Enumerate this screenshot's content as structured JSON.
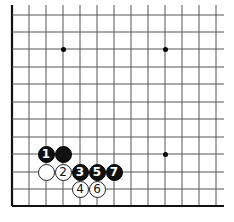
{
  "board": {
    "grid": {
      "x_lines": [
        12,
        29,
        46,
        63,
        80,
        97,
        114,
        131,
        148,
        165,
        182,
        199,
        216
      ],
      "y_lines": [
        15,
        32,
        49,
        67,
        84,
        102,
        119,
        137,
        154,
        172,
        189,
        206
      ],
      "right_extent": 224,
      "top_extent": 5,
      "left_edge_thick": true,
      "bottom_edge_thick": true,
      "line_color": "#555555",
      "edge_color": "#111111"
    },
    "star_points": [
      {
        "col": 3,
        "row": 2
      },
      {
        "col": 9,
        "row": 2
      },
      {
        "col": 9,
        "row": 8
      }
    ],
    "stones": [
      {
        "color": "black",
        "col": 2,
        "row": 8,
        "label": "1"
      },
      {
        "color": "black",
        "col": 3,
        "row": 8,
        "label": ""
      },
      {
        "color": "white",
        "col": 2,
        "row": 9,
        "label": ""
      },
      {
        "color": "white",
        "col": 3,
        "row": 9,
        "label": "2"
      },
      {
        "color": "black",
        "col": 4,
        "row": 9,
        "label": "3"
      },
      {
        "color": "black",
        "col": 5,
        "row": 9,
        "label": "5"
      },
      {
        "color": "black",
        "col": 6,
        "row": 9,
        "label": "7"
      },
      {
        "color": "white",
        "col": 4,
        "row": 10,
        "label": "4"
      },
      {
        "color": "white",
        "col": 5,
        "row": 10,
        "label": "6"
      }
    ]
  }
}
